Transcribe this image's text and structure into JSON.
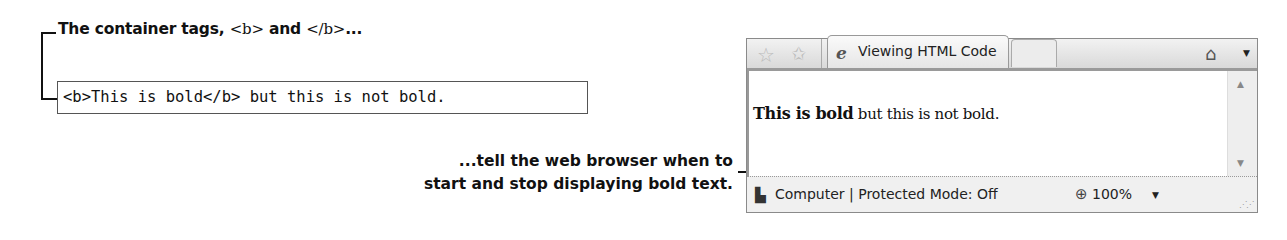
{
  "callout_top": {
    "part1": "The container tags, ",
    "open_tag": "<b>",
    "part2": " and ",
    "close_tag": "</b>",
    "part3": "..."
  },
  "code_sample": "<b>This is bold</b> but this is not bold.",
  "callout_bottom": {
    "line1": "...tell the web browser when to",
    "line2": "start and stop displaying bold text."
  },
  "browser": {
    "icons": {
      "favorites": "favorites-star-icon",
      "add_favorites": "add-favorites-star-icon",
      "tab": "ie-icon",
      "home": "home-icon",
      "status_zone": "computer-icon",
      "zoom": "zoom-magnifier-icon"
    },
    "tab_label": "Viewing HTML Code",
    "page_bold": "This is bold",
    "page_normal": " but this is not bold.",
    "status_text": "Computer | Protected Mode: Off",
    "zoom_level": "100%"
  }
}
